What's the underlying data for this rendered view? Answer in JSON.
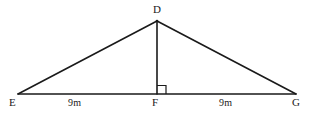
{
  "diagram": {
    "type": "triangle-with-altitude",
    "stroke_color": "#1a1a1a",
    "background_color": "#ffffff",
    "vertices": [
      {
        "id": "D",
        "label": "D",
        "x": 157,
        "y": 21
      },
      {
        "id": "E",
        "label": "E",
        "x": 18,
        "y": 94
      },
      {
        "id": "F",
        "label": "F",
        "x": 157,
        "y": 94
      },
      {
        "id": "G",
        "label": "G",
        "x": 296,
        "y": 94
      }
    ],
    "edges": [
      {
        "id": "DE",
        "from": "D",
        "to": "E"
      },
      {
        "id": "DG",
        "from": "D",
        "to": "G"
      },
      {
        "id": "EG",
        "from": "E",
        "to": "G"
      },
      {
        "id": "DF",
        "from": "D",
        "to": "F",
        "note": "altitude"
      }
    ],
    "segment_labels": [
      {
        "id": "EF",
        "text": "9m",
        "value": 9,
        "unit": "m"
      },
      {
        "id": "FG",
        "text": "9m",
        "value": 9,
        "unit": "m"
      }
    ],
    "right_angle": {
      "at": "F",
      "size": 9,
      "side": "right"
    }
  }
}
